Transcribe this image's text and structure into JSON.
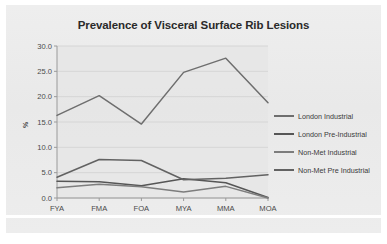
{
  "card": {
    "background": "#ececec"
  },
  "chart_data": {
    "type": "line",
    "title": "Prevalence of Visceral Surface Rib Lesions",
    "xlabel": "",
    "ylabel": "%",
    "categories": [
      "FYA",
      "FMA",
      "FOA",
      "MYA",
      "MMA",
      "MOA"
    ],
    "ylim": [
      0.0,
      30.0
    ],
    "ytick_labels": [
      "0.0",
      "5.0",
      "10.0",
      "15.0",
      "20.0",
      "25.0",
      "30.0"
    ],
    "ytick_values": [
      0.0,
      5.0,
      10.0,
      15.0,
      20.0,
      25.0,
      30.0
    ],
    "grid": true,
    "legend_position": "right",
    "series": [
      {
        "name": "London Industrial",
        "color": "#6e6e6e",
        "values": [
          16.3,
          20.2,
          14.6,
          24.8,
          27.6,
          18.8
        ]
      },
      {
        "name": "London Pre-Industrial",
        "color": "#565656",
        "values": [
          3.3,
          3.2,
          2.4,
          3.8,
          3.0,
          0.1
        ]
      },
      {
        "name": "Non-Met Industrial",
        "color": "#7d7d7d",
        "values": [
          2.0,
          2.7,
          2.2,
          1.2,
          2.3,
          0.0
        ]
      },
      {
        "name": "Non-Met Pre Industrial",
        "color": "#626262",
        "values": [
          4.1,
          7.6,
          7.4,
          3.6,
          3.9,
          4.6
        ]
      }
    ]
  }
}
